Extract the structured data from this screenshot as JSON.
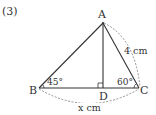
{
  "problem": {
    "number": "(3)"
  },
  "diagram": {
    "points": {
      "A": "A",
      "B": "B",
      "C": "C",
      "D": "D"
    },
    "angles": {
      "B": "45°",
      "C": "60°"
    },
    "lengths": {
      "AC": "4 cm",
      "BC": "x cm"
    },
    "right_angle_at": "D",
    "colors": {
      "line": "#333333",
      "dashed": "#777777"
    }
  }
}
